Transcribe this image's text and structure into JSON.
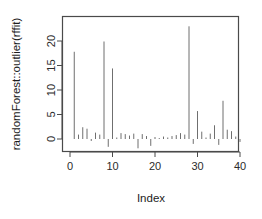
{
  "chart_data": {
    "type": "bar",
    "subtype": "spike-plot-type-h",
    "title": "",
    "subtitle": "",
    "xlabel": "Index",
    "ylabel": "randomForest::outlier(rffit)",
    "xlim": [
      0,
      41
    ],
    "ylim": [
      -2.6,
      23.5
    ],
    "grid": false,
    "legend": null,
    "legend_position": "none",
    "xticks": [
      0,
      10,
      20,
      30,
      40
    ],
    "xtick_labels": [
      "0",
      "10",
      "20",
      "30",
      "40"
    ],
    "yticks": [
      0,
      5,
      10,
      15,
      20
    ],
    "ytick_labels": [
      "0",
      "5",
      "10",
      "15",
      "20"
    ],
    "baseline": 0,
    "line_color": "#6f6f6f",
    "axis_color": "#4a4a4a",
    "x": [
      1,
      2,
      3,
      4,
      5,
      6,
      7,
      8,
      9,
      10,
      11,
      12,
      13,
      14,
      15,
      16,
      17,
      18,
      19,
      20,
      21,
      22,
      23,
      24,
      25,
      26,
      27,
      28,
      29,
      30,
      31,
      32,
      33,
      34,
      35,
      36,
      37,
      38,
      39,
      40
    ],
    "values": [
      17.8,
      0.9,
      2.4,
      2.1,
      -0.4,
      1.3,
      0.9,
      19.9,
      -1.6,
      14.4,
      0.3,
      1.2,
      1.0,
      0.7,
      1.1,
      -1.9,
      1.0,
      0.6,
      -1.4,
      0.4,
      0.2,
      0.5,
      0.3,
      0.6,
      0.8,
      1.2,
      0.9,
      23.0,
      -1.0,
      5.7,
      1.5,
      0.3,
      1.1,
      2.8,
      -1.2,
      7.8,
      1.9,
      1.6,
      0.5,
      -0.6
    ]
  },
  "axes": {
    "y_title": "randomForest::outlier(rffit)",
    "x_title": "Index"
  },
  "tick_labels": {
    "y": [
      "0",
      "5",
      "10",
      "15",
      "20"
    ],
    "x": [
      "0",
      "10",
      "20",
      "30",
      "40"
    ]
  }
}
